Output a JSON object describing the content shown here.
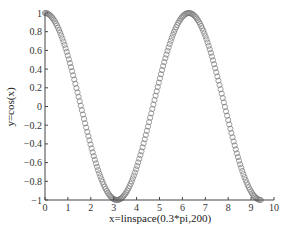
{
  "chart_data": {
    "type": "scatter",
    "title": "",
    "xlabel": "x=linspace(0.3*pi,200)",
    "ylabel": "y=cos(x)",
    "xlim": [
      0,
      10
    ],
    "ylim": [
      -1,
      1
    ],
    "xticks": [
      "0",
      "1",
      "2",
      "3",
      "4",
      "5",
      "6",
      "7",
      "8",
      "9",
      "10"
    ],
    "yticks": [
      "1",
      "0.8",
      "0.6",
      "0.4",
      "0.2",
      "0",
      "−0.2",
      "−0.4",
      "−0.6",
      "−0.8",
      "−1"
    ],
    "grid": false,
    "marker": "open-circle",
    "marker_color": "#777777",
    "series": [
      {
        "name": "cos(x)",
        "n_points": 200,
        "x_start": 0,
        "x_end": 9.42,
        "function": "cos"
      }
    ]
  }
}
